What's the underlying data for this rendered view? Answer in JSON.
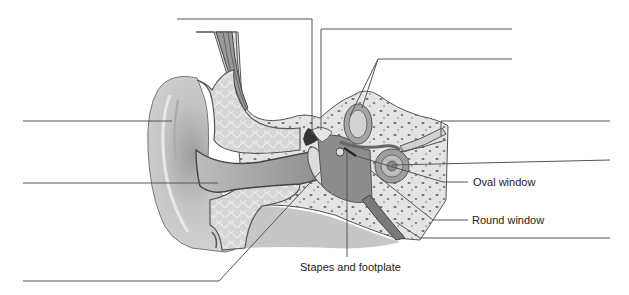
{
  "diagram": {
    "labels": [
      {
        "id": "oval-window",
        "text": "Oval window",
        "x": 473,
        "y": 176
      },
      {
        "id": "round-window",
        "text": "Round window",
        "x": 472,
        "y": 215
      },
      {
        "id": "stapes-footplate",
        "text": "Stapes and footplate",
        "x": 300,
        "y": 261
      }
    ],
    "blank_labels": [
      {
        "id": "blank-top-center",
        "line_from": [
          177,
          19
        ],
        "line_to": [
          312,
          19
        ]
      },
      {
        "id": "blank-top-right-1",
        "line_from": [
          321,
          29
        ],
        "line_to": [
          512,
          29
        ]
      },
      {
        "id": "blank-top-right-2",
        "line_from": [
          378,
          59
        ],
        "line_to": [
          512,
          59
        ]
      },
      {
        "id": "blank-left-1",
        "line_from": [
          23,
          121
        ],
        "line_to": [
          172,
          121
        ]
      },
      {
        "id": "blank-left-2",
        "line_from": [
          23,
          183
        ],
        "line_to": [
          218,
          183
        ]
      },
      {
        "id": "blank-right-1",
        "line_from": [
          441,
          121
        ],
        "line_to": [
          610,
          121
        ]
      },
      {
        "id": "blank-right-2",
        "line_from": [
          430,
          160
        ],
        "line_to": [
          610,
          160
        ]
      },
      {
        "id": "blank-right-3",
        "line_from": [
          420,
          238
        ],
        "line_to": [
          610,
          238
        ]
      },
      {
        "id": "blank-bottom-left",
        "line_from": [
          23,
          281
        ],
        "line_to": [
          219,
          281
        ]
      }
    ]
  },
  "colors": {
    "background": "#ffffff",
    "leader_line": "#555555",
    "skin": "#c9c9c9",
    "skin_dark": "#8a8a8a",
    "bone": "#e2e2e2",
    "bone_spots": "#6a6a6a",
    "cartilage": "#d8d8d8",
    "canal": "#a8a8a8",
    "outline": "#444444"
  }
}
